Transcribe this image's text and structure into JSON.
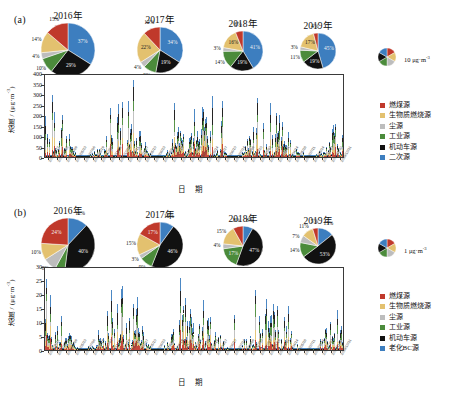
{
  "figure": {
    "panels": [
      {
        "id": "a",
        "label": "(a)",
        "scale_key": {
          "value": "10",
          "unit_prefix": " μg·m",
          "unit_sup": "-3",
          "name": "pie-scale-10"
        },
        "axis": {
          "y_title": "浓度 / (μg·m",
          "y_title_sup": "-3",
          "y_title_tail": ")",
          "y_ticks": [
            "400",
            "350",
            "300",
            "250",
            "200",
            "150",
            "100",
            "50",
            "0"
          ],
          "y_min": 0,
          "y_max": 400,
          "x_title": "日 期"
        },
        "legend": [
          {
            "label": "燃煤源",
            "color": "#C0392B"
          },
          {
            "label": "生物质燃烧源",
            "color": "#E3C16F"
          },
          {
            "label": "尘源",
            "color": "#BDBDBD"
          },
          {
            "label": "工业源",
            "color": "#4B8B3B"
          },
          {
            "label": "机动车源",
            "color": "#111111"
          },
          {
            "label": "二次源",
            "color": "#3D7EBF"
          }
        ],
        "pies": [
          {
            "title": "2016年",
            "radius": 27,
            "slices": [
              {
                "source": "二次源",
                "value": 37,
                "label": "37%",
                "color": "#3D7EBF"
              },
              {
                "source": "机动车源",
                "value": 29,
                "label": "29%",
                "color": "#111111"
              },
              {
                "source": "工业源",
                "value": 10,
                "label": "10%",
                "color": "#4B8B3B"
              },
              {
                "source": "尘源",
                "value": 4,
                "label": "4%",
                "color": "#BDBDBD"
              },
              {
                "source": "生物质燃烧源",
                "value": 14,
                "label": "14%",
                "color": "#E3C16F"
              },
              {
                "source": "燃煤源",
                "value": 15,
                "label": "15%",
                "color": "#C0392B"
              }
            ]
          },
          {
            "title": "2017年",
            "radius": 23,
            "slices": [
              {
                "source": "二次源",
                "value": 34,
                "label": "34%",
                "color": "#3D7EBF"
              },
              {
                "source": "机动车源",
                "value": 19,
                "label": "19%",
                "color": "#111111"
              },
              {
                "source": "工业源",
                "value": 9,
                "label": "9%",
                "color": "#4B8B3B"
              },
              {
                "source": "尘源",
                "value": 4,
                "label": "4%",
                "color": "#BDBDBD"
              },
              {
                "source": "生物质燃烧源",
                "value": 22,
                "label": "22%",
                "color": "#E3C16F"
              },
              {
                "source": "燃煤源",
                "value": 12,
                "label": "12%",
                "color": "#C0392B"
              }
            ]
          },
          {
            "title": "2018年",
            "radius": 20,
            "slices": [
              {
                "source": "二次源",
                "value": 41,
                "label": "41%",
                "color": "#3D7EBF"
              },
              {
                "source": "机动车源",
                "value": 19,
                "label": "19%",
                "color": "#111111"
              },
              {
                "source": "工业源",
                "value": 14,
                "label": "14%",
                "color": "#4B8B3B"
              },
              {
                "source": "尘源",
                "value": 3,
                "label": "3%",
                "color": "#BDBDBD"
              },
              {
                "source": "生物质燃烧源",
                "value": 16,
                "label": "16%",
                "color": "#E3C16F"
              },
              {
                "source": "燃煤源",
                "value": 6,
                "label": "6%",
                "color": "#C0392B"
              }
            ]
          },
          {
            "title": "2019年",
            "radius": 18,
            "slices": [
              {
                "source": "二次源",
                "value": 45,
                "label": "45%",
                "color": "#3D7EBF"
              },
              {
                "source": "机动车源",
                "value": 19,
                "label": "19%",
                "color": "#111111"
              },
              {
                "source": "工业源",
                "value": 11,
                "label": "11%",
                "color": "#4B8B3B"
              },
              {
                "source": "尘源",
                "value": 3,
                "label": "3%",
                "color": "#BDBDBD"
              },
              {
                "source": "生物质燃烧源",
                "value": 17,
                "label": "17%",
                "color": "#E3C16F"
              },
              {
                "source": "燃煤源",
                "value": 4,
                "label": "4%",
                "color": "#C0392B"
              }
            ]
          }
        ]
      },
      {
        "id": "b",
        "label": "(b)",
        "scale_key": {
          "value": "1",
          "unit_prefix": " μg·m",
          "unit_sup": "-3",
          "name": "pie-scale-1"
        },
        "axis": {
          "y_title": "浓度 / (μg·m",
          "y_title_sup": "-3",
          "y_title_tail": ")",
          "y_ticks": [
            "30",
            "25",
            "20",
            "15",
            "10",
            "5",
            "0"
          ],
          "y_min": 0,
          "y_max": 30,
          "x_title": "日 期"
        },
        "legend": [
          {
            "label": "燃煤源",
            "color": "#C0392B"
          },
          {
            "label": "生物质燃烧源",
            "color": "#E3C16F"
          },
          {
            "label": "尘源",
            "color": "#BDBDBD"
          },
          {
            "label": "工业源",
            "color": "#4B8B3B"
          },
          {
            "label": "机动车源",
            "color": "#111111"
          },
          {
            "label": "老化BC源",
            "color": "#3D7EBF"
          }
        ],
        "pies": [
          {
            "title": "2016年",
            "radius": 27,
            "slices": [
              {
                "source": "老化BC源",
                "value": 12,
                "label": "12%",
                "color": "#3D7EBF"
              },
              {
                "source": "机动车源",
                "value": 40,
                "label": "40%",
                "color": "#111111"
              },
              {
                "source": "工业源",
                "value": 6,
                "label": "6%",
                "color": "#4B8B3B"
              },
              {
                "source": "尘源",
                "value": 8,
                "label": "8%",
                "color": "#BDBDBD"
              },
              {
                "source": "生物质燃烧源",
                "value": 10,
                "label": "10%",
                "color": "#E3C16F"
              },
              {
                "source": "燃煤源",
                "value": 24,
                "label": "24%",
                "color": "#C0392B"
              }
            ]
          },
          {
            "title": "2017年",
            "radius": 23,
            "slices": [
              {
                "source": "老化BC源",
                "value": 10,
                "label": "10%",
                "color": "#3D7EBF"
              },
              {
                "source": "机动车源",
                "value": 46,
                "label": "46%",
                "color": "#111111"
              },
              {
                "source": "工业源",
                "value": 9,
                "label": "9%",
                "color": "#4B8B3B"
              },
              {
                "source": "尘源",
                "value": 3,
                "label": "3%",
                "color": "#BDBDBD"
              },
              {
                "source": "生物质燃烧源",
                "value": 15,
                "label": "15%",
                "color": "#E3C16F"
              },
              {
                "source": "燃煤源",
                "value": 17,
                "label": "17%",
                "color": "#C0392B"
              }
            ]
          },
          {
            "title": "2018年",
            "radius": 20,
            "slices": [
              {
                "source": "老化BC源",
                "value": 8,
                "label": "8%",
                "color": "#3D7EBF"
              },
              {
                "source": "机动车源",
                "value": 47,
                "label": "47%",
                "color": "#111111"
              },
              {
                "source": "工业源",
                "value": 17,
                "label": "17%",
                "color": "#4B8B3B"
              },
              {
                "source": "尘源",
                "value": 4,
                "label": "4%",
                "color": "#BDBDBD"
              },
              {
                "source": "生物质燃烧源",
                "value": 15,
                "label": "15%",
                "color": "#E3C16F"
              },
              {
                "source": "燃煤源",
                "value": 8,
                "label": "8%",
                "color": "#C0392B"
              }
            ]
          },
          {
            "title": "2019年",
            "radius": 18,
            "slices": [
              {
                "source": "老化BC源",
                "value": 15,
                "label": "15%",
                "color": "#3D7EBF"
              },
              {
                "source": "机动车源",
                "value": 53,
                "label": "53%",
                "color": "#111111"
              },
              {
                "source": "工业源",
                "value": 14,
                "label": "14%",
                "color": "#4B8B3B"
              },
              {
                "source": "尘源",
                "value": 7,
                "label": "7%",
                "color": "#BDBDBD"
              },
              {
                "source": "生物质燃烧源",
                "value": 11,
                "label": "11%",
                "color": "#E3C16F"
              },
              {
                "source": "燃煤源",
                "value": 5,
                "label": "5%",
                "color": "#C0392B"
              }
            ]
          }
        ]
      }
    ]
  },
  "chart_data": [
    {
      "type": "pie",
      "title": "2016年 (a) PM source apportionment",
      "panel": "a",
      "labels": [
        "二次源",
        "机动车源",
        "工业源",
        "尘源",
        "生物质燃烧源",
        "燃煤源"
      ],
      "values": [
        37,
        29,
        10,
        4,
        14,
        15
      ],
      "unit": "%"
    },
    {
      "type": "pie",
      "title": "2017年 (a)",
      "panel": "a",
      "labels": [
        "二次源",
        "机动车源",
        "工业源",
        "尘源",
        "生物质燃烧源",
        "燃煤源"
      ],
      "values": [
        34,
        19,
        9,
        4,
        22,
        12
      ],
      "unit": "%"
    },
    {
      "type": "pie",
      "title": "2018年 (a)",
      "panel": "a",
      "labels": [
        "二次源",
        "机动车源",
        "工业源",
        "尘源",
        "生物质燃烧源",
        "燃煤源"
      ],
      "values": [
        41,
        19,
        14,
        3,
        16,
        6
      ],
      "unit": "%"
    },
    {
      "type": "pie",
      "title": "2019年 (a)",
      "panel": "a",
      "labels": [
        "二次源",
        "机动车源",
        "工业源",
        "尘源",
        "生物质燃烧源",
        "燃煤源"
      ],
      "values": [
        45,
        19,
        11,
        3,
        17,
        4
      ],
      "unit": "%"
    },
    {
      "type": "pie",
      "title": "2016年 (b) BC source apportionment",
      "panel": "b",
      "labels": [
        "老化BC源",
        "机动车源",
        "工业源",
        "尘源",
        "生物质燃烧源",
        "燃煤源"
      ],
      "values": [
        12,
        40,
        6,
        8,
        10,
        24
      ],
      "unit": "%"
    },
    {
      "type": "pie",
      "title": "2017年 (b)",
      "panel": "b",
      "labels": [
        "老化BC源",
        "机动车源",
        "工业源",
        "尘源",
        "生物质燃烧源",
        "燃煤源"
      ],
      "values": [
        10,
        46,
        9,
        3,
        15,
        17
      ],
      "unit": "%"
    },
    {
      "type": "pie",
      "title": "2018年 (b)",
      "panel": "b",
      "labels": [
        "老化BC源",
        "机动车源",
        "工业源",
        "尘源",
        "生物质燃烧源",
        "燃煤源"
      ],
      "values": [
        8,
        47,
        17,
        4,
        15,
        8
      ],
      "unit": "%"
    },
    {
      "type": "pie",
      "title": "2019年 (b)",
      "panel": "b",
      "labels": [
        "老化BC源",
        "机动车源",
        "工业源",
        "尘源",
        "生物质燃烧源",
        "燃煤源"
      ],
      "values": [
        15,
        53,
        14,
        7,
        11,
        5
      ],
      "unit": "%"
    },
    {
      "type": "bar",
      "panel": "a",
      "title": "浓度 时间序列 (a)",
      "ylabel": "浓度 / (μg·m-3)",
      "xlabel": "日 期",
      "ylim": [
        0,
        400
      ],
      "yticks": [
        0,
        50,
        100,
        150,
        200,
        250,
        300,
        350,
        400
      ],
      "grid": false,
      "stacked": true,
      "note": "Daily stacked source-apportioned mass concentration, 2016/01/12 – 2019/12/31"
    },
    {
      "type": "bar",
      "panel": "b",
      "title": "浓度 时间序列 (b)",
      "ylabel": "浓度 / (μg·m-3)",
      "xlabel": "日 期",
      "ylim": [
        0,
        30
      ],
      "yticks": [
        0,
        5,
        10,
        15,
        20,
        25,
        30
      ],
      "grid": false,
      "stacked": true,
      "note": "Daily stacked BC source-apportioned concentration, 2016/01/12 – 2019/12/31"
    }
  ],
  "x_tick_labels": [
    "2016/01/12",
    "2016/02/25",
    "2016/04/09",
    "2016/05/23",
    "2016/07/06",
    "2016/08/19",
    "2016/10/02",
    "2016/11/15",
    "2016/12/29",
    "2017/02/11",
    "2017/03/27",
    "2017/05/10",
    "2017/06/23",
    "2017/08/06",
    "2017/09/19",
    "2017/11/02",
    "2017/12/16",
    "2018/01/29",
    "2018/03/14",
    "2018/04/27",
    "2018/06/10",
    "2018/07/24",
    "2018/09/06",
    "2018/10/20",
    "2018/12/03",
    "2019/01/16",
    "2019/03/01",
    "2019/04/14",
    "2019/05/28",
    "2019/07/11",
    "2019/08/24",
    "2019/10/07",
    "2019/11/20",
    "2019/12/31"
  ]
}
